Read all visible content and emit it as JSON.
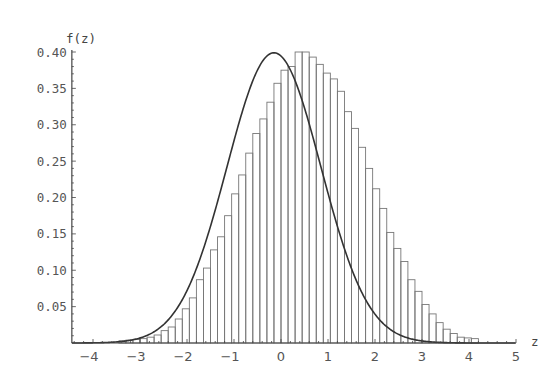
{
  "chart_data": {
    "type": "bar",
    "subtype": "histogram-with-density-curve",
    "title": "",
    "xlabel": "z",
    "ylabel": "f(z)",
    "xlim": [
      -4.45,
      5
    ],
    "ylim": [
      0,
      0.4
    ],
    "x_ticks": [
      -4,
      -3,
      -2,
      -1,
      0,
      1,
      2,
      3,
      4,
      5
    ],
    "x_tick_labels": [
      "-4",
      "-3",
      "-2",
      "-1",
      "0",
      "1",
      "2",
      "3",
      "4",
      "5"
    ],
    "y_ticks": [
      0.05,
      0.1,
      0.15,
      0.2,
      0.25,
      0.3,
      0.35,
      0.4
    ],
    "y_tick_labels": [
      "0.05",
      "0.10",
      "0.15",
      "0.20",
      "0.25",
      "0.30",
      "0.35",
      "0.40"
    ],
    "grid": false,
    "legend": null,
    "bin_width": 0.15,
    "bin_start": -3.45,
    "histogram_values": [
      0.003,
      0.004,
      0.005,
      0.006,
      0.008,
      0.011,
      0.017,
      0.022,
      0.033,
      0.047,
      0.062,
      0.087,
      0.103,
      0.128,
      0.146,
      0.175,
      0.205,
      0.231,
      0.261,
      0.288,
      0.308,
      0.331,
      0.357,
      0.375,
      0.38,
      0.4,
      0.4,
      0.393,
      0.383,
      0.371,
      0.363,
      0.346,
      0.318,
      0.295,
      0.269,
      0.24,
      0.212,
      0.185,
      0.152,
      0.13,
      0.112,
      0.087,
      0.071,
      0.053,
      0.04,
      0.028,
      0.019,
      0.013,
      0.008,
      0.007,
      0.006
    ],
    "curve": {
      "name": "Standard normal density",
      "formula": "f(z) = exp(-z^2/2)/sqrt(2*pi)",
      "mean": -0.15,
      "sd": 1.0,
      "peak": 0.399
    }
  }
}
